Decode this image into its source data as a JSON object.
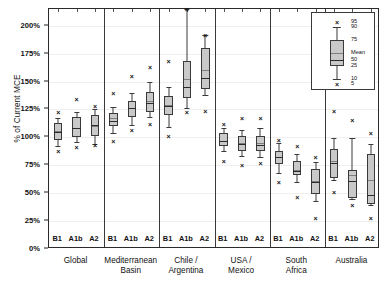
{
  "chart_data": {
    "type": "box",
    "title": "",
    "xlabel": "",
    "ylabel": "% of Current MCE",
    "ylim": [
      0,
      215
    ],
    "yticks": [
      0,
      25,
      50,
      75,
      100,
      125,
      150,
      175,
      200
    ],
    "ytick_labels": [
      "0%",
      "25%",
      "50%",
      "75%",
      "100%",
      "125%",
      "150%",
      "175%",
      "200%"
    ],
    "grid": true,
    "legend_position": "top-right-inset",
    "scenarios": [
      "B1",
      "A1b",
      "A2"
    ],
    "groups": [
      {
        "name": "Global",
        "boxes": [
          {
            "scenario": "B1",
            "p5": 88,
            "p10": 92,
            "p25": 98,
            "median": 105,
            "mean": 106,
            "p75": 113,
            "p90": 117,
            "p95": 123
          },
          {
            "scenario": "A1b",
            "p5": 91,
            "p10": 96,
            "p25": 100,
            "median": 108,
            "mean": 108,
            "p75": 118,
            "p90": 123,
            "p95": 134
          },
          {
            "scenario": "A2",
            "p5": 93,
            "p10": 94,
            "p25": 101,
            "median": 111,
            "mean": 110,
            "p75": 120,
            "p90": 125,
            "p95": 128
          }
        ]
      },
      {
        "name": "Mediterranean Basin",
        "boxes": [
          {
            "scenario": "B1",
            "p5": 97,
            "p10": 104,
            "p25": 110,
            "median": 115,
            "mean": 117,
            "p75": 122,
            "p90": 127,
            "p95": 140
          },
          {
            "scenario": "A1b",
            "p5": 107,
            "p10": 111,
            "p25": 118,
            "median": 126,
            "mean": 126,
            "p75": 133,
            "p90": 140,
            "p95": 155
          },
          {
            "scenario": "A2",
            "p5": 112,
            "p10": 118,
            "p25": 123,
            "median": 131,
            "mean": 133,
            "p75": 141,
            "p90": 150,
            "p95": 163
          }
        ]
      },
      {
        "name": "Chile / Argentina",
        "boxes": [
          {
            "scenario": "B1",
            "p5": 101,
            "p10": 109,
            "p25": 120,
            "median": 128,
            "mean": 129,
            "p75": 137,
            "p90": 145,
            "p95": 168
          },
          {
            "scenario": "A1b",
            "p5": 123,
            "p10": 126,
            "p25": 135,
            "median": 145,
            "mean": 152,
            "p75": 168,
            "p90": 215,
            "p95": 215
          },
          {
            "scenario": "A2",
            "p5": 124,
            "p10": 138,
            "p25": 143,
            "median": 153,
            "mean": 160,
            "p75": 180,
            "p90": 192,
            "p95": 192
          }
        ]
      },
      {
        "name": "USA / Mexico",
        "boxes": [
          {
            "scenario": "B1",
            "p5": 79,
            "p10": 88,
            "p25": 92,
            "median": 97,
            "mean": 97,
            "p75": 104,
            "p90": 108,
            "p95": 112
          },
          {
            "scenario": "A1b",
            "p5": 75,
            "p10": 83,
            "p25": 88,
            "median": 94,
            "mean": 95,
            "p75": 101,
            "p90": 107,
            "p95": 117
          },
          {
            "scenario": "A2",
            "p5": 77,
            "p10": 82,
            "p25": 88,
            "median": 93,
            "mean": 95,
            "p75": 101,
            "p90": 108,
            "p95": 117
          }
        ]
      },
      {
        "name": "South Africa",
        "boxes": [
          {
            "scenario": "B1",
            "p5": 60,
            "p10": 68,
            "p25": 76,
            "median": 82,
            "mean": 82,
            "p75": 88,
            "p90": 95,
            "p95": 98
          },
          {
            "scenario": "A1b",
            "p5": 47,
            "p10": 60,
            "p25": 66,
            "median": 70,
            "mean": 71,
            "p75": 79,
            "p90": 85,
            "p95": 92
          },
          {
            "scenario": "A2",
            "p5": 28,
            "p10": 43,
            "p25": 49,
            "median": 60,
            "mean": 61,
            "p75": 72,
            "p90": 78,
            "p95": 82
          }
        ]
      },
      {
        "name": "Australia",
        "boxes": [
          {
            "scenario": "B1",
            "p5": 51,
            "p10": 62,
            "p25": 64,
            "median": 77,
            "mean": 79,
            "p75": 90,
            "p90": 99,
            "p95": 124
          },
          {
            "scenario": "A1b",
            "p5": 39,
            "p10": 45,
            "p25": 46,
            "median": 61,
            "mean": 66,
            "p75": 71,
            "p90": 99,
            "p95": 116
          },
          {
            "scenario": "A2",
            "p5": 28,
            "p10": 39,
            "p25": 40,
            "median": 48,
            "mean": 62,
            "p75": 85,
            "p90": 94,
            "p95": 104
          }
        ]
      }
    ],
    "legend": {
      "title": "",
      "items": [
        "95",
        "90",
        "75",
        "Mean",
        "50",
        "25",
        "10",
        "5"
      ]
    }
  }
}
